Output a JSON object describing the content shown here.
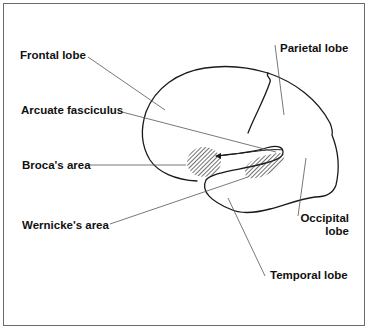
{
  "diagram": {
    "type": "labeled anatomical diagram",
    "labels": {
      "frontal_lobe": "Frontal lobe",
      "parietal_lobe": "Parietal lobe",
      "arcuate_fasciculus": "Arcuate fasciculus",
      "brocas_area": "Broca's area",
      "wernickes_area": "Wernicke's area",
      "occipital_lobe_line1": "Occipital",
      "occipital_lobe_line2": "lobe",
      "temporal_lobe": "Temporal lobe"
    },
    "hatched_regions": [
      "Broca's area",
      "Wernicke's area"
    ],
    "colors": {
      "line": "#1a1a1a",
      "leader": "#555555",
      "hatch": "#333333",
      "background": "#ffffff",
      "frame": "#6a6a6a"
    }
  }
}
